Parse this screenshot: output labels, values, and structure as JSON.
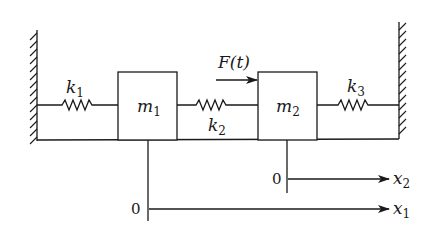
{
  "diagram": {
    "type": "two-mass three-spring system",
    "masses": [
      {
        "id": "m1",
        "symbol": "m",
        "sub": "1"
      },
      {
        "id": "m2",
        "symbol": "m",
        "sub": "2"
      }
    ],
    "springs": [
      {
        "id": "k1",
        "symbol": "k",
        "sub": "1",
        "connects": "left-wall to m1"
      },
      {
        "id": "k2",
        "symbol": "k",
        "sub": "2",
        "connects": "m1 to m2"
      },
      {
        "id": "k3",
        "symbol": "k",
        "sub": "3",
        "connects": "m2 to right-wall"
      }
    ],
    "force": {
      "label": "F(t)",
      "acts_on": "m2",
      "direction": "right"
    },
    "axes": [
      {
        "id": "x1",
        "symbol": "x",
        "sub": "1",
        "origin_label": "0",
        "attached_to": "m1"
      },
      {
        "id": "x2",
        "symbol": "x",
        "sub": "2",
        "origin_label": "0",
        "attached_to": "m2"
      }
    ],
    "colors": {
      "ink": "#1a1a1a",
      "background": "#ffffff"
    }
  }
}
